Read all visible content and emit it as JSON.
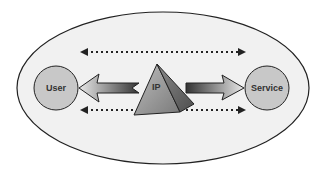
{
  "diagram": {
    "nodes": [
      {
        "id": "user",
        "label": "User",
        "shape": "circle"
      },
      {
        "id": "ip",
        "label": "IP",
        "shape": "pyramid"
      },
      {
        "id": "service",
        "label": "Service",
        "shape": "circle"
      }
    ],
    "edges": [
      {
        "from": "ip",
        "to": "user",
        "style": "solid-arrow"
      },
      {
        "from": "ip",
        "to": "service",
        "style": "solid-arrow"
      },
      {
        "from": "user",
        "to": "service",
        "style": "dotted-double-arrow",
        "position": "top"
      },
      {
        "from": "user",
        "to": "service",
        "style": "dotted-double-arrow",
        "position": "bottom"
      }
    ],
    "container": {
      "shape": "ellipse"
    },
    "colors": {
      "ellipse_fill": "#f1f1f1",
      "circle_fill": "#c8c8c8",
      "stroke": "#222222",
      "pyramid_light": "#a9a9a9",
      "pyramid_dark": "#6e6e6e"
    }
  }
}
